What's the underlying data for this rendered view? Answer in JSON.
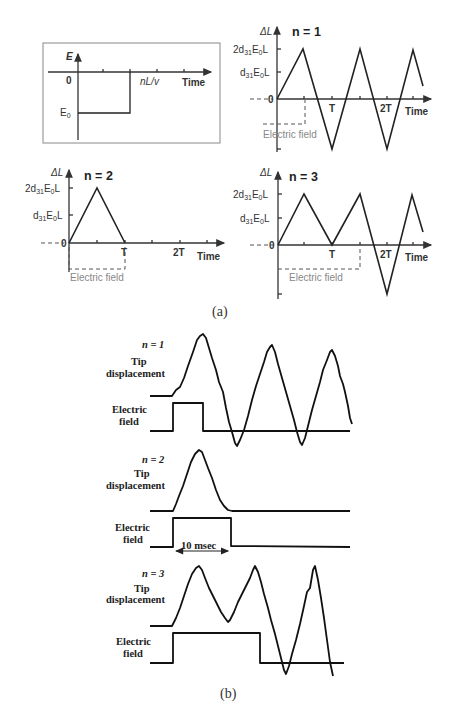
{
  "figure": {
    "caption_a": "(a)",
    "caption_b": "(b)"
  },
  "inset": {
    "y_label": "E",
    "origin": "0",
    "step_label": "nL/v",
    "x_label": "Time",
    "level_label": "E",
    "level_sub": "0"
  },
  "panel_n1": {
    "title": "n = 1",
    "y_label": "ΔL",
    "ytick_2": "2d",
    "ytick_1": "d",
    "sub31": "31",
    "E": "E",
    "sub0": "0",
    "L": "L",
    "origin": "0",
    "xtick_T": "T",
    "xtick_2T": "2T",
    "x_label": "Time",
    "field_label": "Electric field"
  },
  "panel_n2": {
    "title": "n = 2",
    "y_label": "ΔL",
    "origin": "0",
    "xtick_T": "T",
    "xtick_2T": "2T",
    "x_label": "Time",
    "field_label": "Electric field"
  },
  "panel_n3": {
    "title": "n = 3",
    "y_label": "ΔL",
    "origin": "0",
    "xtick_T": "T",
    "xtick_2T": "2T",
    "x_label": "Time",
    "field_label": "Electric field"
  },
  "measured": {
    "n1": {
      "title": "n = 1",
      "tip1": "Tip",
      "tip2": "displacement",
      "field1": "Electric",
      "field2": "field"
    },
    "n2": {
      "title": "n = 2",
      "tip1": "Tip",
      "tip2": "displacement",
      "field1": "Electric",
      "field2": "field",
      "duration": "10 msec"
    },
    "n3": {
      "title": "n = 3",
      "tip1": "Tip",
      "tip2": "displacement",
      "field1": "Electric",
      "field2": "field"
    }
  }
}
